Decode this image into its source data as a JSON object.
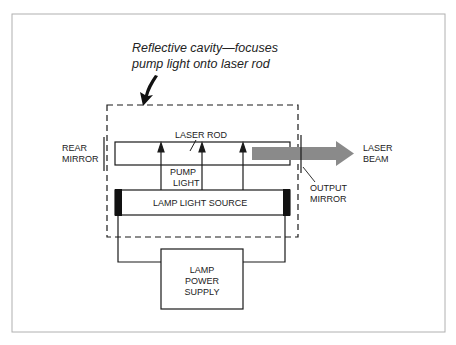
{
  "diagram": {
    "caption": {
      "line1": "Reflective cavity—focuses",
      "line2": "pump light onto laser rod"
    },
    "labels": {
      "laser_rod": "LASER ROD",
      "rear_mirror_1": "REAR",
      "rear_mirror_2": "MIRROR",
      "pump_light_1": "PUMP",
      "pump_light_2": "LIGHT",
      "lamp_light_source": "LAMP LIGHT SOURCE",
      "laser_beam_1": "LASER",
      "laser_beam_2": "BEAM",
      "output_mirror_1": "OUTPUT",
      "output_mirror_2": "MIRROR",
      "power_supply_1": "LAMP",
      "power_supply_2": "POWER",
      "power_supply_3": "SUPPLY"
    },
    "colors": {
      "line": "#1a1a1a",
      "beam": "#8a8a8a",
      "frame": "#b0b0b0",
      "end_cap": "#111111"
    }
  }
}
